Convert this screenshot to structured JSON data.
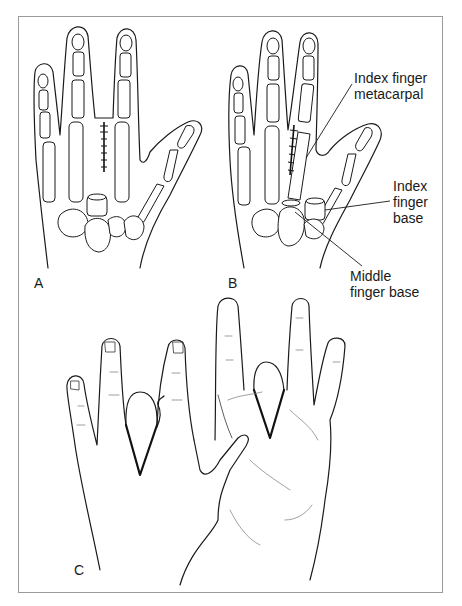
{
  "figure": {
    "panels": [
      {
        "id": "A",
        "label": "A",
        "description": "Hand skeleton with middle finger removed and wound sutured"
      },
      {
        "id": "B",
        "label": "B",
        "description": "Index finger transposed onto middle finger base"
      },
      {
        "id": "C",
        "label": "C",
        "description": "Hands showing V-shaped wedge excision outline"
      }
    ],
    "annotations": {
      "index_metacarpal_line1": "Index finger",
      "index_metacarpal_line2": "metacarpal",
      "index_base_line1": "Index",
      "index_base_line2": "finger",
      "index_base_line3": "base",
      "middle_base_line1": "Middle",
      "middle_base_line2": "finger base"
    },
    "colors": {
      "line": "#1a1a1a",
      "frame": "#9a9a9a",
      "background": "#ffffff"
    }
  }
}
